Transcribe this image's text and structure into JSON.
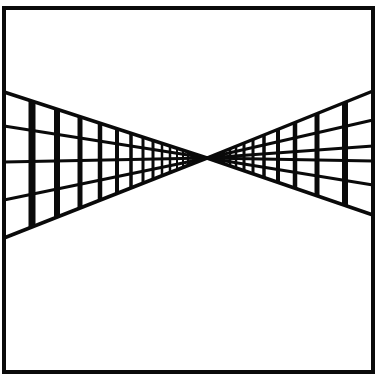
{
  "figure": {
    "title": "",
    "colors": {
      "ink": "#0a0a0a",
      "paper": "#ffffff"
    },
    "frame": {
      "x1": 4,
      "y1": 8,
      "x2": 373,
      "y2": 372,
      "stroke_width": 4
    },
    "vanishing_point": {
      "x": 207,
      "y": 158
    },
    "left_grid": {
      "edge_x": 4,
      "horizontal_ys_at_edge": [
        92,
        126,
        162,
        200,
        238
      ],
      "vertical_xs": [
        32,
        57,
        80,
        100,
        117,
        131,
        143,
        153,
        162,
        170,
        177,
        183,
        188,
        193,
        197
      ],
      "vertical_widths": [
        7,
        6,
        5,
        4.5,
        4,
        3.5,
        3,
        3,
        2.5,
        2.5,
        2,
        2,
        2,
        1.5,
        1.5
      ]
    },
    "right_grid": {
      "edge_x": 373,
      "horizontal_ys_at_edge": [
        91,
        120,
        146,
        161,
        185,
        215
      ],
      "vertical_xs": [
        345,
        317,
        295,
        278,
        264,
        253,
        244,
        236,
        230,
        224,
        219,
        215,
        212
      ],
      "vertical_widths": [
        6,
        5,
        4.5,
        4,
        3.5,
        3,
        3,
        2.5,
        2.5,
        2,
        2,
        1.5,
        1.5
      ]
    }
  }
}
